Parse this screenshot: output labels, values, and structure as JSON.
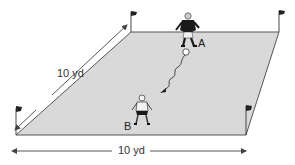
{
  "diagram": {
    "type": "soccer-drill-field",
    "field": {
      "shape": "parallelogram-perspective",
      "fill_color": "#d9d9d9",
      "edge_color": "#555555",
      "corners": {
        "top_left": [
          131,
          32
        ],
        "top_right": [
          279,
          32
        ],
        "bottom_right": [
          246,
          135
        ],
        "bottom_left": [
          16,
          135
        ]
      },
      "flags": [
        {
          "position": "top-left",
          "x": 131,
          "y": 32
        },
        {
          "position": "top-right",
          "x": 279,
          "y": 32
        },
        {
          "position": "bottom-right",
          "x": 246,
          "y": 135
        },
        {
          "position": "bottom-left",
          "x": 16,
          "y": 135
        }
      ]
    },
    "dimensions": {
      "depth_label": "10 yd",
      "width_label": "10 yd"
    },
    "players": [
      {
        "id": "A",
        "label": "A",
        "jersey": "dark",
        "x": 190,
        "y": 25
      },
      {
        "id": "B",
        "label": "B",
        "jersey": "light",
        "x": 142,
        "y": 108
      }
    ],
    "ball": {
      "x": 186,
      "y": 52,
      "color": "#ffffff"
    },
    "dribble_path": {
      "style": "wavy-arrow",
      "from": "ball",
      "to_direction": "player-B",
      "start": [
        186,
        52
      ],
      "end": [
        163,
        91
      ]
    },
    "colors": {
      "line": "#444444",
      "field": "#d9d9d9",
      "player_dark": "#1a1a1a",
      "player_light": "#f2f2f2"
    }
  }
}
